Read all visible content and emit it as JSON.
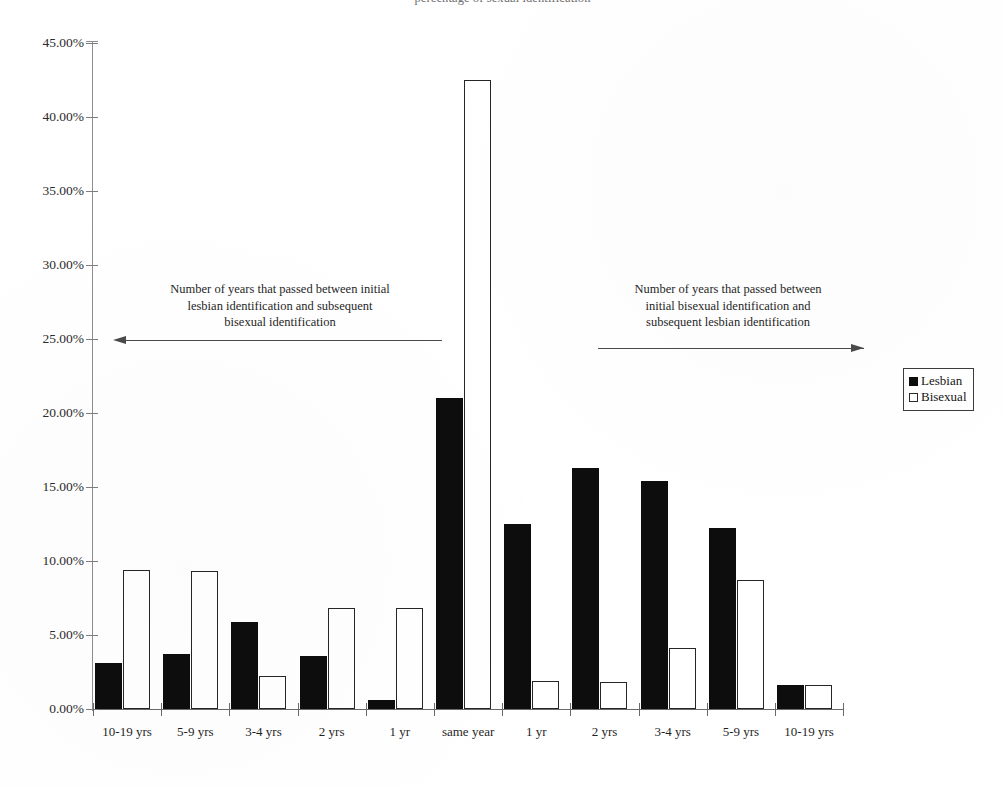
{
  "title": "percentage of sexual identification",
  "legend": {
    "position": "right",
    "items": [
      {
        "label": "Lesbian",
        "swatch": "filled-black-square",
        "color": "#0d0d0d"
      },
      {
        "label": "Bisexual",
        "swatch": "hollow-white-square",
        "color": "#ffffff"
      }
    ]
  },
  "annotations": [
    {
      "name": "left-direction-note",
      "lines": [
        "Number of years that passed between initial",
        "lesbian identification and subsequent",
        "bisexual identification"
      ],
      "arrow": "left-pointing-arrow"
    },
    {
      "name": "right-direction-note",
      "lines": [
        "Number of years that passed between",
        "initial bisexual identification and",
        "subsequent lesbian identification"
      ],
      "arrow": "right-pointing-arrow"
    }
  ],
  "axis": {
    "y_ticks": [
      "45.00%",
      "40.00%",
      "35.00%",
      "30.00%",
      "25.00%",
      "20.00%",
      "15.00%",
      "10.00%",
      "5.00%",
      "0.00%"
    ],
    "x_labels": [
      "10-19 yrs",
      "5-9 yrs",
      "3-4 yrs",
      "2 yrs",
      "1 yr",
      "same year",
      "1 yr",
      "2 yrs",
      "3-4 yrs",
      "5-9 yrs",
      "10-19 yrs"
    ]
  },
  "chart_data": {
    "type": "bar",
    "title": "percentage of sexual identification",
    "xlabel": "",
    "ylabel": "",
    "ylim": [
      0,
      45
    ],
    "ytick_step": 5,
    "ytick_format": "percent",
    "grid": false,
    "legend_position": "right",
    "categories": [
      "10-19 yrs",
      "5-9 yrs",
      "3-4 yrs",
      "2 yrs",
      "1 yr",
      "same year",
      "1 yr",
      "2 yrs",
      "3-4 yrs",
      "5-9 yrs",
      "10-19 yrs"
    ],
    "series": [
      {
        "name": "Lesbian",
        "color": "#0d0d0d",
        "values": [
          3.1,
          3.75,
          5.9,
          3.6,
          0.6,
          21.0,
          12.5,
          16.3,
          15.4,
          12.2,
          1.6
        ]
      },
      {
        "name": "Bisexual",
        "color": "#ffffff",
        "values": [
          9.4,
          9.35,
          2.2,
          6.8,
          6.8,
          42.5,
          1.9,
          1.8,
          4.1,
          8.7,
          1.65
        ]
      }
    ]
  }
}
